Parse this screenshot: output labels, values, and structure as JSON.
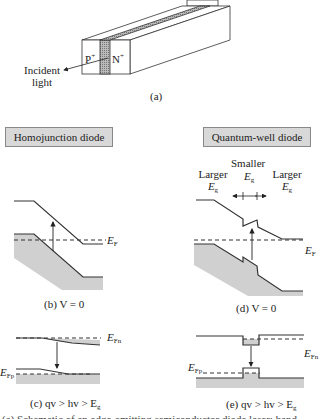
{
  "figure": {
    "panel_a": {
      "p_label": "P",
      "p_sup": "+",
      "n_label": "N",
      "n_sup": "+",
      "incident_label_1": "Incident",
      "incident_label_2": "light",
      "caption": "(a)"
    },
    "homojunction": {
      "title": "Homojunction diode",
      "ef_label": "E",
      "ef_sub": "F",
      "caption_b": "(b) V = 0",
      "efn_label": "E",
      "efn_sub": "Fn",
      "efp_label": "E",
      "efp_sub": "Fp",
      "caption_c": "(c) qv > hv > E",
      "caption_c_sub": "g"
    },
    "quantum_well": {
      "title": "Quantum-well diode",
      "smaller_label": "Smaller",
      "smaller_eg": "E",
      "smaller_eg_sub": "g",
      "larger_left": "Larger",
      "larger_left_eg": "E",
      "larger_left_eg_sub": "g",
      "larger_right": "Larger",
      "larger_right_eg": "E",
      "larger_right_eg_sub": "g",
      "ef_label": "E",
      "ef_sub": "F",
      "caption_d": "(d) V = 0",
      "efn_label": "E",
      "efn_sub": "Fn",
      "efp_label": "E",
      "efp_sub": "Fp",
      "caption_e": "(e) qv > hv > E",
      "caption_e_sub": "g"
    },
    "bottom_caption_cropped": "(a) Schematic of an edge-emitting semiconductor diode laser; band diagrams ..."
  },
  "colors": {
    "line": "#333333",
    "fill_gray": "#d0d0d0",
    "box_gray": "#d8d8d8",
    "hatch": "#888888"
  }
}
